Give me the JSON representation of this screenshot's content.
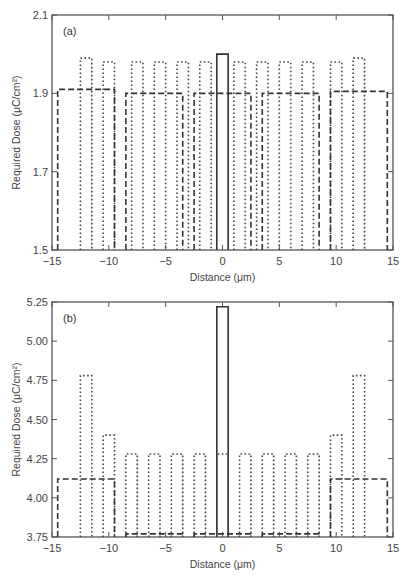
{
  "chart_data": [
    {
      "type": "line",
      "panel_label": "(a)",
      "xlabel": "Distance (μm)",
      "ylabel": "Required Dose (μC/cm²)",
      "xlim": [
        -15,
        15
      ],
      "ylim": [
        1.5,
        2.1
      ],
      "x_ticks": [
        -15,
        -10,
        -5,
        0,
        5,
        10,
        15
      ],
      "x_tick_labels": [
        "−15",
        "−10",
        "−5",
        "0",
        "5",
        "10",
        "15"
      ],
      "y_ticks": [
        1.5,
        1.7,
        1.9,
        2.1
      ],
      "y_tick_labels": [
        "1.5",
        "1.7",
        "1.9",
        "2.1"
      ],
      "grid": false,
      "series": [
        {
          "name": "isolated line",
          "style": "solid",
          "segments": [
            {
              "x0": -0.5,
              "x1": 0.5,
              "y": 2.0
            }
          ]
        },
        {
          "name": "line array",
          "style": "dotted",
          "segments": [
            {
              "x0": -12.5,
              "x1": -11.5,
              "y": 1.99
            },
            {
              "x0": -10.5,
              "x1": -9.5,
              "y": 1.98
            },
            {
              "x0": -8.0,
              "x1": -7.0,
              "y": 1.98
            },
            {
              "x0": -6.0,
              "x1": -5.0,
              "y": 1.98
            },
            {
              "x0": -4.0,
              "x1": -3.0,
              "y": 1.98
            },
            {
              "x0": -2.0,
              "x1": -1.0,
              "y": 1.98
            },
            {
              "x0": 1.0,
              "x1": 2.0,
              "y": 1.98
            },
            {
              "x0": 3.0,
              "x1": 4.0,
              "y": 1.98
            },
            {
              "x0": 5.0,
              "x1": 6.0,
              "y": 1.98
            },
            {
              "x0": 7.0,
              "x1": 8.0,
              "y": 1.98
            },
            {
              "x0": 9.5,
              "x1": 10.5,
              "y": 1.98
            },
            {
              "x0": 11.5,
              "x1": 12.5,
              "y": 1.99
            }
          ]
        },
        {
          "name": "large pads",
          "style": "dashed",
          "segments": [
            {
              "x0": -14.5,
              "x1": -9.5,
              "y": 1.91
            },
            {
              "x0": -8.5,
              "x1": -3.5,
              "y": 1.9
            },
            {
              "x0": -2.5,
              "x1": 2.5,
              "y": 1.9
            },
            {
              "x0": 3.5,
              "x1": 8.5,
              "y": 1.9
            },
            {
              "x0": 9.5,
              "x1": 14.5,
              "y": 1.905
            }
          ]
        }
      ]
    },
    {
      "type": "line",
      "panel_label": "(b)",
      "xlabel": "Distance (μm)",
      "ylabel": "Required Dose (μC/cm²)",
      "xlim": [
        -15,
        15
      ],
      "ylim": [
        3.75,
        5.25
      ],
      "x_ticks": [
        -15,
        -10,
        -5,
        0,
        5,
        10,
        15
      ],
      "x_tick_labels": [
        "−15",
        "−10",
        "−5",
        "0",
        "5",
        "10",
        "15"
      ],
      "y_ticks": [
        3.75,
        4.0,
        4.25,
        4.5,
        4.75,
        5.0,
        5.25
      ],
      "y_tick_labels": [
        "3.75",
        "4.00",
        "4.25",
        "4.50",
        "4.75",
        "5.00",
        "5.25"
      ],
      "grid": false,
      "series": [
        {
          "name": "isolated line",
          "style": "solid",
          "segments": [
            {
              "x0": -0.5,
              "x1": 0.5,
              "y": 5.22
            }
          ]
        },
        {
          "name": "line array",
          "style": "dotted",
          "segments": [
            {
              "x0": -12.5,
              "x1": -11.5,
              "y": 4.78
            },
            {
              "x0": -10.5,
              "x1": -9.5,
              "y": 4.4
            },
            {
              "x0": -8.5,
              "x1": -7.5,
              "y": 4.28
            },
            {
              "x0": -6.5,
              "x1": -5.5,
              "y": 4.28
            },
            {
              "x0": -4.5,
              "x1": -3.5,
              "y": 4.28
            },
            {
              "x0": -2.5,
              "x1": -1.5,
              "y": 4.28
            },
            {
              "x0": -0.5,
              "x1": 0.5,
              "y": 4.28
            },
            {
              "x0": 1.5,
              "x1": 2.5,
              "y": 4.28
            },
            {
              "x0": 3.5,
              "x1": 4.5,
              "y": 4.28
            },
            {
              "x0": 5.5,
              "x1": 6.5,
              "y": 4.28
            },
            {
              "x0": 7.5,
              "x1": 8.5,
              "y": 4.28
            },
            {
              "x0": 9.5,
              "x1": 10.5,
              "y": 4.4
            },
            {
              "x0": 11.5,
              "x1": 12.5,
              "y": 4.78
            }
          ]
        },
        {
          "name": "large pads",
          "style": "dashed",
          "segments": [
            {
              "x0": -14.5,
              "x1": -9.5,
              "y": 4.12
            },
            {
              "x0": -8.5,
              "x1": -3.5,
              "y": 3.77
            },
            {
              "x0": -2.5,
              "x1": 2.5,
              "y": 3.77
            },
            {
              "x0": 3.5,
              "x1": 8.5,
              "y": 3.77
            },
            {
              "x0": 9.5,
              "x1": 14.5,
              "y": 4.12
            }
          ]
        }
      ]
    }
  ],
  "panels": [
    {
      "label": "(a)",
      "xlabel": "Distance (μm)",
      "ylabel": "Required Dose (μC/cm²)"
    },
    {
      "label": "(b)",
      "xlabel": "Distance (μm)",
      "ylabel": "Required Dose (μC/cm²)"
    }
  ]
}
